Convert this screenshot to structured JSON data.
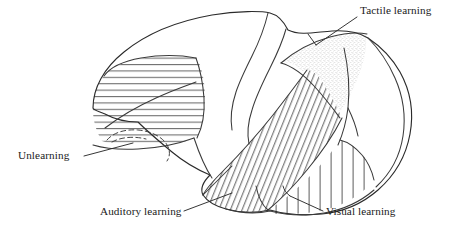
{
  "figure": {
    "background_color": "#ffffff",
    "ink_color": "#2b2b2b",
    "width": 467,
    "height": 237
  },
  "annotations": [
    {
      "id": "tactile",
      "label": "Tactile learning",
      "region": "parietal-stippled-region",
      "texture": "stipple",
      "text_x": 360,
      "text_y": 14,
      "leader": "M 357 17 L 316 45"
    },
    {
      "id": "unlearning",
      "label": "Unlearning",
      "region": "frontal-horizontal-hatch-region",
      "texture": "horizontal-lines",
      "text_x": 18,
      "text_y": 159,
      "leader": "M 84 156 L 120 145"
    },
    {
      "id": "auditory",
      "label": "Auditory learning",
      "region": "temporal-diagonal-hatch-region",
      "texture": "diagonal-lines",
      "text_x": 100,
      "text_y": 215,
      "leader": "M 184 211 L 228 194"
    },
    {
      "id": "visual",
      "label": "Visual learning",
      "region": "occipital-vertical-hatch-region",
      "texture": "vertical-lines",
      "text_x": 326,
      "text_y": 215,
      "leader": "M 323 211 L 288 195"
    }
  ],
  "textures": {
    "horizontal": "horizontal-hatch",
    "diagonal": "diagonal-hatch",
    "vertical": "vertical-hatch",
    "stipple": "stipple-dots"
  }
}
